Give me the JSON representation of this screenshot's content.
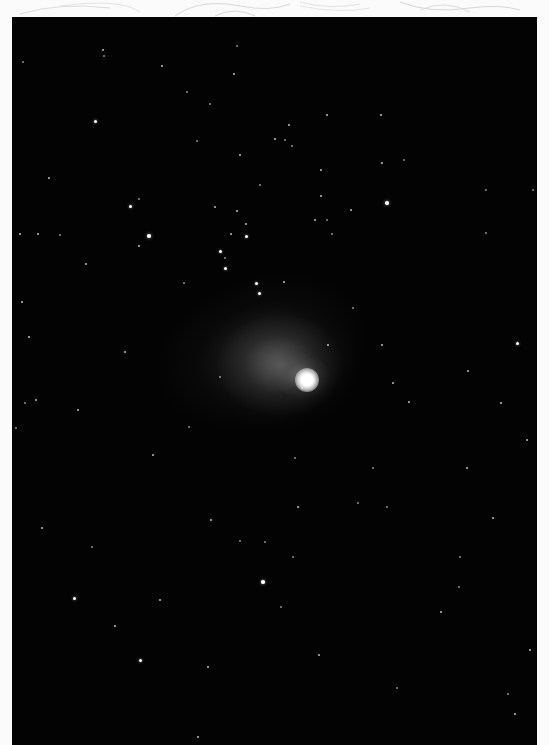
{
  "image": {
    "subject": "comet with diffuse coma and faint tail on star field",
    "colors": {
      "background_page": "#fbfbfb",
      "sky": "#030303",
      "star": "#ffffff",
      "sketch_lines": "#d9d9d9"
    },
    "frame": {
      "x": 12,
      "y": 17,
      "width": 525,
      "height": 728
    },
    "comet": {
      "nucleus": {
        "x": 307,
        "y": 380,
        "r": 8
      },
      "coma": {
        "cx": 290,
        "cy": 365,
        "rx": 80,
        "ry": 65
      },
      "tail_direction": "upper-left"
    },
    "stars": [
      {
        "x": 103,
        "y": 50,
        "s": 2
      },
      {
        "x": 104,
        "y": 56,
        "s": 1.5
      },
      {
        "x": 162,
        "y": 66,
        "s": 2
      },
      {
        "x": 23,
        "y": 62,
        "s": 1.5
      },
      {
        "x": 234,
        "y": 74,
        "s": 2
      },
      {
        "x": 237,
        "y": 46,
        "s": 1.5
      },
      {
        "x": 187,
        "y": 92,
        "s": 1.5
      },
      {
        "x": 210,
        "y": 104,
        "s": 1.5
      },
      {
        "x": 95,
        "y": 121,
        "s": 3
      },
      {
        "x": 197,
        "y": 141,
        "s": 1.5
      },
      {
        "x": 240,
        "y": 155,
        "s": 2.5
      },
      {
        "x": 275,
        "y": 139,
        "s": 2
      },
      {
        "x": 49,
        "y": 178,
        "s": 2
      },
      {
        "x": 260,
        "y": 185,
        "s": 1.5
      },
      {
        "x": 130,
        "y": 206,
        "s": 3
      },
      {
        "x": 139,
        "y": 199,
        "s": 1.5
      },
      {
        "x": 149,
        "y": 236,
        "s": 3.5
      },
      {
        "x": 215,
        "y": 207,
        "s": 2
      },
      {
        "x": 237,
        "y": 211,
        "s": 2
      },
      {
        "x": 246,
        "y": 224,
        "s": 2
      },
      {
        "x": 231,
        "y": 234,
        "s": 2
      },
      {
        "x": 246,
        "y": 236,
        "s": 3
      },
      {
        "x": 220,
        "y": 251,
        "s": 3
      },
      {
        "x": 225,
        "y": 258,
        "s": 1.5
      },
      {
        "x": 20,
        "y": 234,
        "s": 2
      },
      {
        "x": 38,
        "y": 234,
        "s": 2
      },
      {
        "x": 60,
        "y": 235,
        "s": 1.5
      },
      {
        "x": 139,
        "y": 246,
        "s": 2
      },
      {
        "x": 86,
        "y": 264,
        "s": 2
      },
      {
        "x": 225,
        "y": 268,
        "s": 3
      },
      {
        "x": 256,
        "y": 283,
        "s": 3
      },
      {
        "x": 259,
        "y": 293,
        "s": 3
      },
      {
        "x": 289,
        "y": 125,
        "s": 2
      },
      {
        "x": 285,
        "y": 140,
        "s": 1.5
      },
      {
        "x": 292,
        "y": 146,
        "s": 1.5
      },
      {
        "x": 321,
        "y": 170,
        "s": 2
      },
      {
        "x": 327,
        "y": 115,
        "s": 2
      },
      {
        "x": 381,
        "y": 115,
        "s": 2
      },
      {
        "x": 382,
        "y": 163,
        "s": 2
      },
      {
        "x": 404,
        "y": 160,
        "s": 1.5
      },
      {
        "x": 321,
        "y": 196,
        "s": 2
      },
      {
        "x": 327,
        "y": 220,
        "s": 1.5
      },
      {
        "x": 387,
        "y": 203,
        "s": 3.5
      },
      {
        "x": 351,
        "y": 210,
        "s": 2
      },
      {
        "x": 315,
        "y": 220,
        "s": 2
      },
      {
        "x": 332,
        "y": 234,
        "s": 1.5
      },
      {
        "x": 486,
        "y": 190,
        "s": 1.5
      },
      {
        "x": 533,
        "y": 190,
        "s": 1.5
      },
      {
        "x": 486,
        "y": 233,
        "s": 1.5
      },
      {
        "x": 22,
        "y": 302,
        "s": 2
      },
      {
        "x": 29,
        "y": 337,
        "s": 2.5
      },
      {
        "x": 125,
        "y": 352,
        "s": 2.5
      },
      {
        "x": 25,
        "y": 403,
        "s": 1.5
      },
      {
        "x": 36,
        "y": 400,
        "s": 2
      },
      {
        "x": 78,
        "y": 410,
        "s": 2.5
      },
      {
        "x": 16,
        "y": 428,
        "s": 1.5
      },
      {
        "x": 189,
        "y": 427,
        "s": 1.5
      },
      {
        "x": 153,
        "y": 455,
        "s": 2.5
      },
      {
        "x": 184,
        "y": 283,
        "s": 1.5
      },
      {
        "x": 220,
        "y": 377,
        "s": 1.5
      },
      {
        "x": 284,
        "y": 282,
        "s": 2.5
      },
      {
        "x": 328,
        "y": 345,
        "s": 2
      },
      {
        "x": 382,
        "y": 345,
        "s": 2.5
      },
      {
        "x": 393,
        "y": 383,
        "s": 2.5
      },
      {
        "x": 409,
        "y": 402,
        "s": 2.5
      },
      {
        "x": 468,
        "y": 371,
        "s": 2
      },
      {
        "x": 501,
        "y": 403,
        "s": 2
      },
      {
        "x": 517,
        "y": 343,
        "s": 3
      },
      {
        "x": 527,
        "y": 440,
        "s": 2.5
      },
      {
        "x": 467,
        "y": 468,
        "s": 2.5
      },
      {
        "x": 373,
        "y": 468,
        "s": 1.5
      },
      {
        "x": 353,
        "y": 308,
        "s": 1.5
      },
      {
        "x": 295,
        "y": 458,
        "s": 1.5
      },
      {
        "x": 302,
        "y": 388,
        "s": 1.5
      },
      {
        "x": 42,
        "y": 528,
        "s": 2
      },
      {
        "x": 211,
        "y": 520,
        "s": 2
      },
      {
        "x": 92,
        "y": 547,
        "s": 1.5
      },
      {
        "x": 74,
        "y": 598,
        "s": 3
      },
      {
        "x": 160,
        "y": 600,
        "s": 2
      },
      {
        "x": 115,
        "y": 626,
        "s": 2
      },
      {
        "x": 140,
        "y": 660,
        "s": 3
      },
      {
        "x": 208,
        "y": 667,
        "s": 2
      },
      {
        "x": 263,
        "y": 582,
        "s": 3.5
      },
      {
        "x": 240,
        "y": 541,
        "s": 1.5
      },
      {
        "x": 265,
        "y": 542,
        "s": 1.5
      },
      {
        "x": 198,
        "y": 737,
        "s": 2.5
      },
      {
        "x": 298,
        "y": 507,
        "s": 2
      },
      {
        "x": 358,
        "y": 503,
        "s": 1.5
      },
      {
        "x": 387,
        "y": 507,
        "s": 1.5
      },
      {
        "x": 493,
        "y": 518,
        "s": 2
      },
      {
        "x": 293,
        "y": 557,
        "s": 1.5
      },
      {
        "x": 459,
        "y": 587,
        "s": 1.5
      },
      {
        "x": 441,
        "y": 612,
        "s": 2.5
      },
      {
        "x": 281,
        "y": 607,
        "s": 1.5
      },
      {
        "x": 319,
        "y": 655,
        "s": 2.5
      },
      {
        "x": 397,
        "y": 688,
        "s": 1.5
      },
      {
        "x": 530,
        "y": 650,
        "s": 2
      },
      {
        "x": 508,
        "y": 694,
        "s": 1.5
      },
      {
        "x": 515,
        "y": 714,
        "s": 2.5
      },
      {
        "x": 460,
        "y": 557,
        "s": 1.5
      }
    ]
  }
}
